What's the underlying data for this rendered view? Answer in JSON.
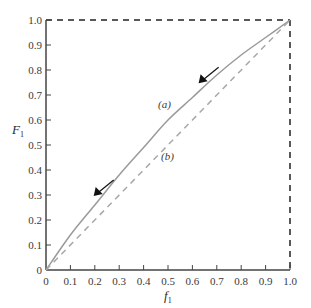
{
  "chart_data": {
    "type": "line",
    "title": "",
    "xlabel": "f1",
    "ylabel": "F1",
    "xlim": [
      0,
      1.0
    ],
    "ylim": [
      0,
      1.0
    ],
    "grid": false,
    "x_ticks": [
      "0",
      "0.1",
      "0.2",
      "0.3",
      "0.4",
      "0.5",
      "0.6",
      "0.7",
      "0.8",
      "0.9",
      "1.0"
    ],
    "y_ticks": [
      "0",
      "0.1",
      "0.2",
      "0.3",
      "0.4",
      "0.5",
      "0.6",
      "0.7",
      "0.8",
      "0.9",
      "1.0"
    ],
    "series": [
      {
        "name": "(a)",
        "style": "solid",
        "color": "#9a9a9a",
        "x": [
          0,
          0.1,
          0.2,
          0.3,
          0.4,
          0.5,
          0.6,
          0.7,
          0.8,
          0.9,
          1.0
        ],
        "y": [
          0,
          0.14,
          0.26,
          0.38,
          0.49,
          0.6,
          0.69,
          0.78,
          0.86,
          0.93,
          1.0
        ]
      },
      {
        "name": "(b)",
        "style": "dashed",
        "color": "#a8a8a8",
        "x": [
          0,
          1.0
        ],
        "y": [
          0,
          1.0
        ]
      }
    ],
    "annotations": [
      {
        "text": "(a)",
        "x": 0.49,
        "y": 0.67
      },
      {
        "text": "(b)",
        "x": 0.5,
        "y": 0.44
      },
      {
        "type": "arrow",
        "direction": "down-left",
        "along": "(a)",
        "at_x": 0.22
      },
      {
        "type": "arrow",
        "direction": "down-left",
        "along": "(a)",
        "at_x": 0.65
      }
    ],
    "boundary": "dashed lines at F1=1.0 and f1=1.0"
  },
  "labels": {
    "ylabel_main": "F",
    "ylabel_sub": "1",
    "xlabel_main": "f",
    "xlabel_sub": "1",
    "curve_a": "(a)",
    "curve_b": "(b)"
  }
}
